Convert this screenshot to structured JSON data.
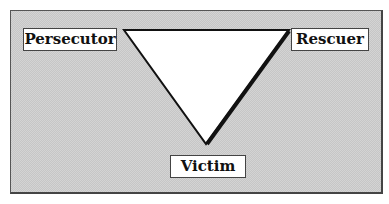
{
  "diagram": {
    "type": "drama-triangle",
    "nodes": [
      {
        "id": "persecutor",
        "label": "Persecutor",
        "position": "top-left"
      },
      {
        "id": "rescuer",
        "label": "Rescuer",
        "position": "top-right"
      },
      {
        "id": "victim",
        "label": "Victim",
        "position": "bottom"
      }
    ],
    "edges": [
      {
        "from": "persecutor",
        "to": "rescuer"
      },
      {
        "from": "rescuer",
        "to": "victim"
      },
      {
        "from": "victim",
        "to": "persecutor"
      }
    ],
    "colors": {
      "background_pattern": "#d0d0d0",
      "triangle_fill": "#ffffff",
      "stroke": "#111111"
    }
  }
}
